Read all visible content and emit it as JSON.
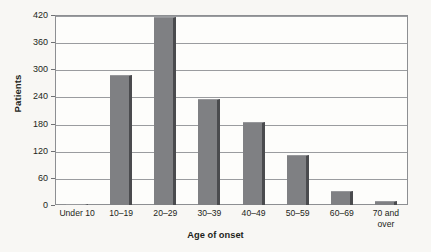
{
  "chart_data": {
    "type": "bar",
    "title": "",
    "subtitle": "",
    "xlabel": "Age of onset",
    "ylabel": "Patients",
    "categories": [
      "Under 10",
      "10–19",
      "20–29",
      "30–39",
      "40–49",
      "50–59",
      "60–69",
      "70 and over"
    ],
    "values": [
      2,
      287,
      415,
      235,
      183,
      111,
      30,
      8
    ],
    "series": [
      {
        "name": "Patients",
        "values": [
          2,
          287,
          415,
          235,
          183,
          111,
          30,
          8
        ]
      }
    ],
    "ylim": [
      0,
      420
    ],
    "yticks": [
      0,
      60,
      120,
      180,
      240,
      300,
      360,
      420
    ],
    "ytick_labels": [
      "0",
      "60",
      "120",
      "180",
      "240",
      "300",
      "360",
      "420"
    ],
    "grid": "horizontal",
    "legend": "none",
    "bar_color": "#7f8083",
    "bar_edge_color": "#4a4b4e",
    "plot_background": "#fdfdfb",
    "figure_background": "#f8f7f4",
    "axis_color": "#8d8f92"
  },
  "xlabels_multiline": [
    [
      "Under 10"
    ],
    [
      "10–19"
    ],
    [
      "20–29"
    ],
    [
      "30–39"
    ],
    [
      "40–49"
    ],
    [
      "50–59"
    ],
    [
      "60–69"
    ],
    [
      "70 and",
      "over"
    ]
  ]
}
